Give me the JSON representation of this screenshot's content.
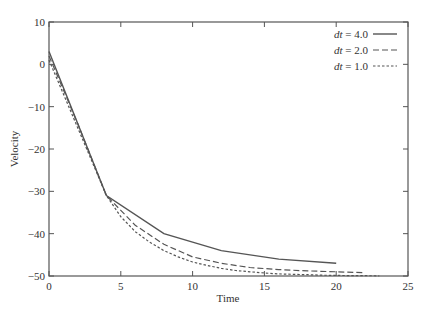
{
  "chart_data": {
    "type": "line",
    "title": "",
    "xlabel": "Time",
    "ylabel": "Velocity",
    "xlim": [
      0,
      25
    ],
    "ylim": [
      -50,
      10
    ],
    "xticks": [
      0,
      5,
      10,
      15,
      20,
      25
    ],
    "yticks": [
      10,
      0,
      -10,
      -20,
      -30,
      -40,
      -50
    ],
    "grid": false,
    "legend_position": "upper right",
    "series": [
      {
        "name": "dt = 4.0",
        "style": "solid",
        "x": [
          0,
          4,
          8,
          12,
          16,
          20
        ],
        "y": [
          3,
          -31,
          -40,
          -44,
          -46,
          -47
        ]
      },
      {
        "name": "dt = 2.0",
        "style": "dashed",
        "x": [
          0,
          2,
          4,
          6,
          8,
          10,
          12,
          14,
          16,
          18,
          20,
          22
        ],
        "y": [
          2,
          -14,
          -31,
          -38,
          -42.5,
          -45.5,
          -47,
          -48,
          -48.5,
          -48.8,
          -49,
          -49.2
        ]
      },
      {
        "name": "dt = 1.0",
        "style": "dotted",
        "x": [
          0,
          1,
          2,
          3,
          4,
          5,
          6,
          7,
          8,
          9,
          10,
          11,
          12,
          13,
          14,
          15,
          16,
          17,
          18,
          19,
          20,
          21,
          22,
          23
        ],
        "y": [
          1,
          -7,
          -15,
          -23,
          -31,
          -36,
          -39.5,
          -42,
          -44,
          -45.5,
          -46.7,
          -47.5,
          -48.2,
          -48.7,
          -49,
          -49.3,
          -49.5,
          -49.6,
          -49.7,
          -49.8,
          -49.85,
          -49.9,
          -49.92,
          -49.95
        ]
      }
    ]
  },
  "legend": {
    "items": [
      {
        "prefix": "dt",
        "value": " = 4.0"
      },
      {
        "prefix": "dt",
        "value": " = 2.0"
      },
      {
        "prefix": "dt",
        "value": " = 1.0"
      }
    ]
  },
  "axes": {
    "xlabel": "Time",
    "ylabel": "Velocity",
    "xtick_labels": [
      "0",
      "5",
      "10",
      "15",
      "20",
      "25"
    ],
    "ytick_labels": [
      "10",
      "0",
      "−10",
      "−20",
      "−30",
      "−40",
      "−50"
    ]
  }
}
